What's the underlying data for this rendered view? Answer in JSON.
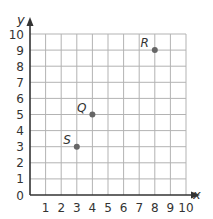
{
  "chart_data": {
    "type": "scatter",
    "title": "",
    "xlabel": "x",
    "ylabel": "y",
    "xlim": [
      0,
      10
    ],
    "ylim": [
      0,
      10
    ],
    "grid": true,
    "x_ticks": [
      "1",
      "2",
      "3",
      "4",
      "5",
      "6",
      "7",
      "8",
      "9",
      "10"
    ],
    "y_ticks": [
      "0",
      "1",
      "2",
      "3",
      "4",
      "5",
      "6",
      "7",
      "8",
      "9",
      "10"
    ],
    "points": [
      {
        "label": "R",
        "x": 8,
        "y": 9
      },
      {
        "label": "Q",
        "x": 4,
        "y": 5
      },
      {
        "label": "S",
        "x": 3,
        "y": 3
      }
    ],
    "colors": {
      "grid": "#b3b3b3",
      "axis": "#333333",
      "point": "#666666"
    }
  }
}
